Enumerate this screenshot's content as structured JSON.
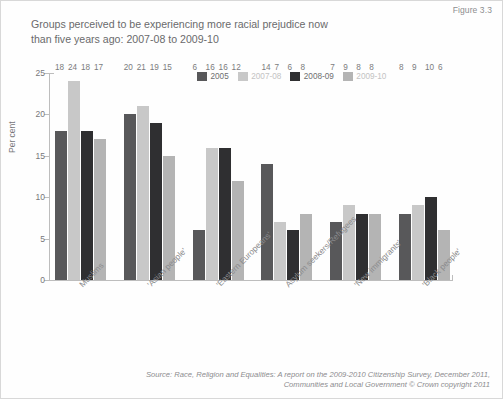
{
  "figure_number": "Figure 3.3",
  "title": "Groups perceived to be experiencing more racial prejudice now than five years ago: 2007-08 to 2009-10",
  "title_line1": "Groups perceived to be experiencing more racial prejudice now",
  "title_line2": "than five years ago: 2007-08 to 2009-10",
  "axis": {
    "ylabel": "Per cent",
    "yticks": [
      "0",
      "5",
      "10",
      "15",
      "20",
      "25"
    ]
  },
  "legend": {
    "items": [
      {
        "label": "2005",
        "color": "#58585a",
        "faint": false
      },
      {
        "label": "2007-08",
        "color": "#c8c8c8",
        "faint": true
      },
      {
        "label": "2008-09",
        "color": "#2f2f31",
        "faint": false
      },
      {
        "label": "2009-10",
        "color": "#b4b4b4",
        "faint": true
      }
    ]
  },
  "source": {
    "line1": "Source: Race, Religion and Equalities: A report on the 2009-2010 Citizenship Survey, December 2011,",
    "line2": "Communities and Local Government © Crown copyright 2011"
  },
  "chart_data": {
    "type": "bar",
    "title": "Groups perceived to be experiencing more racial prejudice now than five years ago: 2007-08 to 2009-10",
    "xlabel": "",
    "ylabel": "Per cent",
    "ylim": [
      0,
      25
    ],
    "yticks": [
      0,
      5,
      10,
      15,
      20,
      25
    ],
    "grid": false,
    "legend_position": "top-center",
    "categories": [
      "Muslims",
      "'Asian people'",
      "'Eastern Europeans'",
      "Asylum seekers/Refugees",
      "'New immigrants'",
      "'Black people'"
    ],
    "series": [
      {
        "name": "2005",
        "color": "#58585a",
        "values": [
          18,
          20,
          6,
          14,
          7,
          8
        ]
      },
      {
        "name": "2007-08",
        "color": "#c8c8c8",
        "values": [
          24,
          21,
          16,
          7,
          9,
          9
        ]
      },
      {
        "name": "2008-09",
        "color": "#2f2f31",
        "values": [
          18,
          19,
          16,
          6,
          8,
          10
        ]
      },
      {
        "name": "2009-10",
        "color": "#b4b4b4",
        "values": [
          17,
          15,
          12,
          8,
          8,
          6
        ]
      }
    ]
  }
}
